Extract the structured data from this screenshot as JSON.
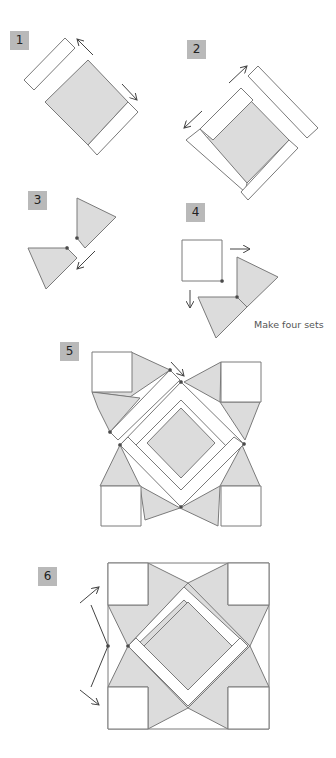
{
  "steps": [
    {
      "number": "1"
    },
    {
      "number": "2"
    },
    {
      "number": "3"
    },
    {
      "number": "4",
      "caption": "Make four sets"
    },
    {
      "number": "5"
    },
    {
      "number": "6"
    }
  ],
  "colors": {
    "fill_gray": "#dcdcdc",
    "stroke": "#7a7a7a",
    "badge": "#b9b9b9",
    "white": "#ffffff"
  }
}
